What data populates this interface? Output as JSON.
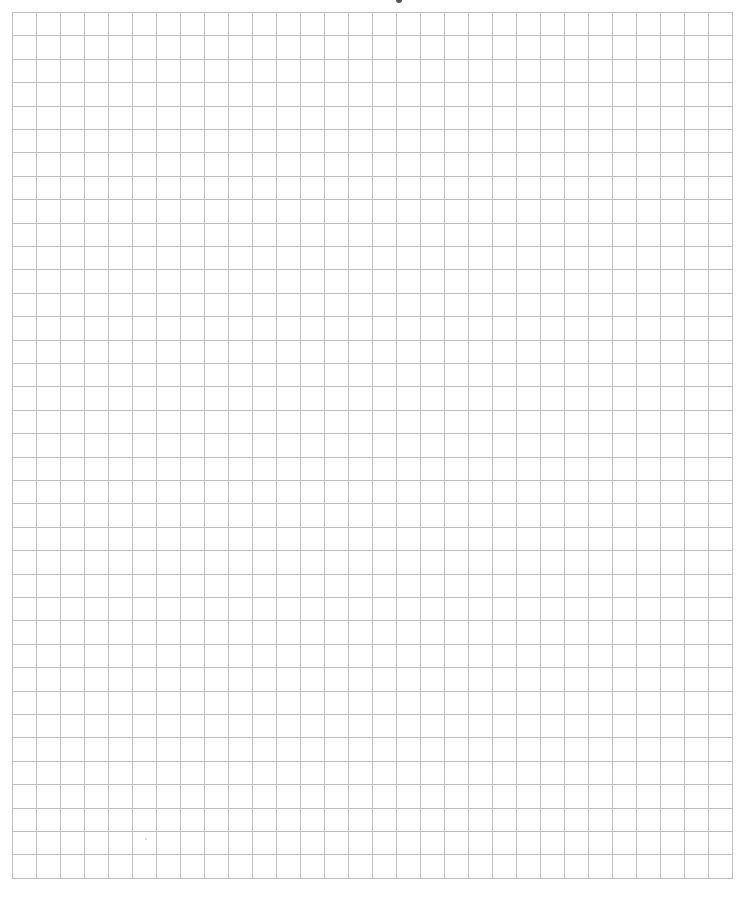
{
  "page": {
    "type": "graph-paper",
    "background_color": "#ffffff"
  },
  "grid": {
    "left": 12,
    "top": 12,
    "columns": 30,
    "rows": 37,
    "cell_width": 24,
    "cell_height": 23.4,
    "line_color": "#bfbfbf",
    "line_width": 1
  },
  "marks": {
    "top_fragment": {
      "x": 396,
      "y": 0,
      "color": "#555555"
    },
    "stray_dot": {
      "x": 145,
      "y": 838,
      "color": "#d0d0d0"
    }
  }
}
